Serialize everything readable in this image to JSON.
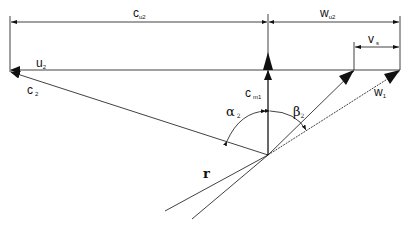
{
  "diagram": {
    "labels": {
      "cu2": {
        "main": "c",
        "sub": "u2"
      },
      "wu2": {
        "main": "w",
        "sub": "u2"
      },
      "vs": {
        "main": "v",
        "sub": "s"
      },
      "u2": {
        "main": "u",
        "sub": "2"
      },
      "c2": {
        "main": "c",
        "sub": "2"
      },
      "cm1": {
        "main": "c",
        "sub": "m1"
      },
      "w1": {
        "main": "w",
        "sub": "1"
      },
      "alpha2": {
        "main": "α",
        "sub": "2"
      },
      "beta2": {
        "main": "β",
        "sub": "2"
      },
      "r": "r"
    },
    "colors": {
      "line": "#111111",
      "background": "#ffffff"
    }
  }
}
